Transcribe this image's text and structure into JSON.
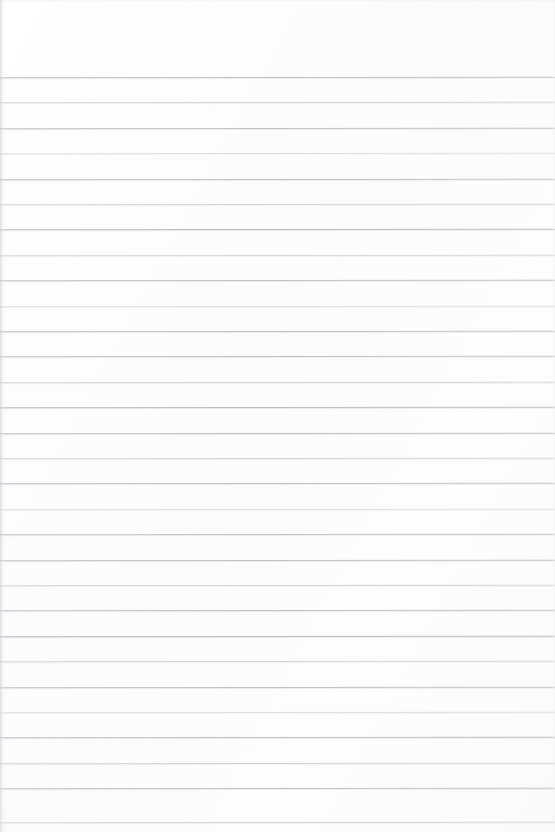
{
  "document": {
    "kind": "blank-lined-paper-scan",
    "title": "Blank ruled notebook page",
    "has_text_content": false,
    "has_handwriting": false,
    "has_margin_rule": false,
    "orientation": "portrait"
  },
  "page": {
    "width": 555,
    "height": 832,
    "background_color": "#fdfdfd",
    "paper_tone": "#fcfcfd"
  },
  "ruling": {
    "line_color": "#babec4",
    "line_thickness_px": 1,
    "line_count": 30,
    "spacing_px": 25.4,
    "first_line_y": 77,
    "last_line_y": 822,
    "top_margin_px": 77,
    "spans_full_width": true,
    "line_positions": [
      77,
      102,
      128,
      153,
      179,
      204,
      229,
      255,
      280,
      306,
      331,
      356,
      382,
      407,
      433,
      458,
      483,
      509,
      534,
      560,
      585,
      610,
      636,
      661,
      687,
      712,
      737,
      763,
      788,
      822
    ],
    "line_opacity": [
      0.92,
      0.62,
      0.92,
      0.48,
      0.92,
      0.62,
      1.0,
      0.62,
      0.92,
      0.48,
      0.92,
      0.92,
      0.62,
      1.0,
      0.92,
      0.62,
      0.92,
      0.48,
      0.92,
      0.92,
      0.62,
      0.92,
      1.0,
      0.62,
      0.92,
      0.48,
      0.92,
      0.62,
      0.92,
      0.62
    ]
  },
  "artifacts": {
    "left_edge_shadow": true,
    "left_edge_shadow_color": "#c4c8ce",
    "left_edge_shadow_width_px": 6,
    "top_edge_shadow": true,
    "right_edge_shadow": true,
    "vignette": true
  }
}
